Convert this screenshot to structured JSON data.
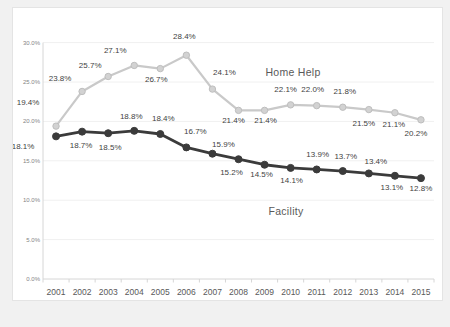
{
  "page": {
    "background_color": "#f1f1f1",
    "card_background": "#ffffff",
    "card_border_color": "#e4e4e4"
  },
  "chart_data": {
    "type": "line",
    "title": "",
    "xlabel": "",
    "ylabel": "",
    "categories": [
      "2001",
      "2002",
      "2003",
      "2004",
      "2005",
      "2006",
      "2007",
      "2008",
      "2009",
      "2010",
      "2011",
      "2012",
      "2013",
      "2014",
      "2015"
    ],
    "ylim": [
      0,
      30
    ],
    "y_ticks": [
      "0.0%",
      "5.0%",
      "10.0%",
      "15.0%",
      "20.0%",
      "25.0%",
      "30.0%"
    ],
    "grid": true,
    "legend_position": "inline-annotations",
    "colors": {
      "grid_line": "#f0f0f0",
      "axis_line": "#d6d6d6",
      "tick_mark": "#d6d6d6",
      "y_tick_label": "#848484",
      "x_tick_label": "#595959",
      "data_label": "#3f3f3f",
      "annotation_text": "#595959"
    },
    "series": [
      {
        "name": "Home Help",
        "color": "#c9c9c9",
        "marker_fill": "#d2d2d2",
        "marker_stroke": "#bebebe",
        "values": [
          19.4,
          23.8,
          25.7,
          27.1,
          26.7,
          28.4,
          24.1,
          21.4,
          21.4,
          22.1,
          22.0,
          21.8,
          21.5,
          21.1,
          20.2
        ],
        "labels": [
          "19.4%",
          "23.8%",
          "25.7%",
          "27.1%",
          "26.7%",
          "28.4%",
          "24.1%",
          "21.4%",
          "21.4%",
          "22.1%",
          "22.0%",
          "21.8%",
          "21.5%",
          "21.1%",
          "20.2%"
        ],
        "label_offsets": [
          [
            -28,
            -24
          ],
          [
            -22,
            -13
          ],
          [
            -18,
            -11
          ],
          [
            -19,
            -15
          ],
          [
            -4,
            11
          ],
          [
            -2,
            -19
          ],
          [
            12,
            -17
          ],
          [
            -5,
            10
          ],
          [
            1,
            10
          ],
          [
            -5,
            -15
          ],
          [
            -4,
            -16
          ],
          [
            2,
            -16
          ],
          [
            -5,
            14
          ],
          [
            -1,
            12
          ],
          [
            -5,
            14
          ]
        ]
      },
      {
        "name": "Facility",
        "color": "#3b3b3b",
        "marker_fill": "#3b3b3b",
        "marker_stroke": "#3b3b3b",
        "values": [
          18.1,
          18.7,
          18.5,
          18.8,
          18.4,
          16.7,
          15.9,
          15.2,
          14.5,
          14.1,
          13.9,
          13.7,
          13.4,
          13.1,
          12.8
        ],
        "labels": [
          "18.1%",
          "18.7%",
          "18.5%",
          "18.8%",
          "18.4%",
          "16.7%",
          "15.9%",
          "15.2%",
          "14.5%",
          "14.1%",
          "13.9%",
          "13.7%",
          "13.4%",
          "13.1%",
          "12.8%"
        ],
        "label_offsets": [
          [
            -33,
            10
          ],
          [
            -1,
            14
          ],
          [
            2,
            14
          ],
          [
            -3,
            -14
          ],
          [
            3,
            -16
          ],
          [
            9,
            -16
          ],
          [
            11,
            -9
          ],
          [
            -7,
            13
          ],
          [
            -3,
            10
          ],
          [
            1,
            13
          ],
          [
            1,
            -15
          ],
          [
            3,
            -15
          ],
          [
            7,
            -12
          ],
          [
            -3,
            12
          ],
          [
            0,
            10
          ]
        ]
      }
    ],
    "annotations": [
      {
        "text": "Home Help",
        "series": "Home Help",
        "x": 280,
        "y": 64
      },
      {
        "text": "Facility",
        "series": "Facility",
        "x": 273,
        "y": 203
      }
    ]
  }
}
